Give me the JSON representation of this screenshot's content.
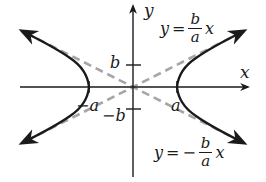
{
  "diagram": {
    "axes": {
      "x_label": "x",
      "y_label": "y"
    },
    "ticks": {
      "pos_a": "a",
      "neg_a": "−a",
      "pos_b": "b",
      "neg_b": "−b"
    },
    "asymptote_upper": {
      "lhs": "y",
      "eq": "=",
      "sign": "",
      "num": "b",
      "den": "a",
      "var": "x"
    },
    "asymptote_lower": {
      "lhs": "y",
      "eq": "=",
      "sign": "−",
      "num": "b",
      "den": "a",
      "var": "x"
    },
    "colors": {
      "curve": "#1a1a1a",
      "axes": "#1a1a1a",
      "asymptotes": "#a6a6a6",
      "background": "#ffffff"
    }
  }
}
